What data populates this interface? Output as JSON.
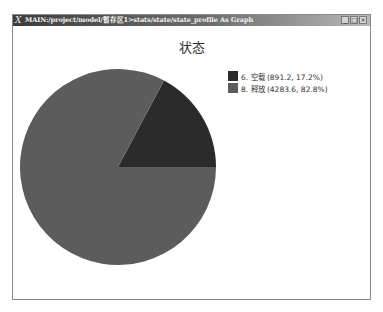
{
  "window": {
    "title": "MAIN:/project/model/暂存区1>stats/state/state_profile As Graph",
    "app_icon": "X",
    "buttons": [
      {
        "name": "minimize",
        "glyph": "_"
      },
      {
        "name": "maximize",
        "glyph": "□"
      },
      {
        "name": "close",
        "glyph": "×"
      }
    ]
  },
  "chart_data": {
    "type": "pie",
    "title": "状态",
    "categories": [
      "6. 空载",
      "8. 释放"
    ],
    "values": [
      891.2,
      4283.6
    ],
    "percentages": [
      17.2,
      82.8
    ],
    "colors": [
      "#2b2b2b",
      "#5c5c5c"
    ],
    "legend_position": "right",
    "start_angle_deg": 0,
    "direction": "counterclockwise"
  },
  "legend": {
    "items": [
      {
        "label": "6. 空载 (891.2, 17.2%)",
        "color": "#2b2b2b"
      },
      {
        "label": "8. 释放 (4283.6, 82.8%)",
        "color": "#5c5c5c"
      }
    ]
  }
}
